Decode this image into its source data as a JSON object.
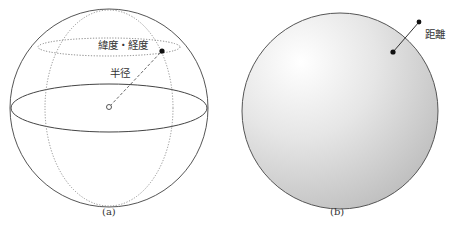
{
  "panel_a": {
    "caption": "(a)",
    "labels": {
      "lat_long": "緯度・経度",
      "radius": "半径"
    }
  },
  "panel_b": {
    "caption": "(b)",
    "labels": {
      "distance": "距離"
    }
  },
  "colors": {
    "stroke": "#555555",
    "sphere_fill_light": "#ffffff",
    "sphere_fill_dark": "#bdbdbd",
    "point": "#111111"
  }
}
